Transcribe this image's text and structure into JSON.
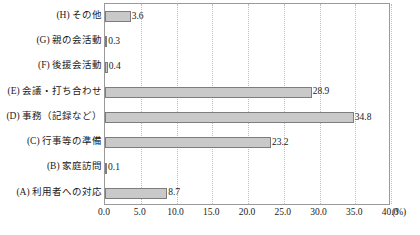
{
  "chart_data": {
    "type": "bar",
    "orientation": "horizontal",
    "title": "",
    "xlabel": "(%)",
    "ylabel": "",
    "xlim": [
      0.0,
      40.0
    ],
    "xticks": [
      "0.0",
      "5.0",
      "10.0",
      "15.0",
      "20.0",
      "25.0",
      "30.0",
      "35.0",
      "40.0"
    ],
    "xtick_values": [
      0.0,
      5.0,
      10.0,
      15.0,
      20.0,
      25.0,
      30.0,
      35.0,
      40.0
    ],
    "grid": "vertical-dotted",
    "legend": "none",
    "axis_unit": "(%)",
    "categories": [
      "(H) その他",
      "(G) 親の会活動",
      "(F) 後援会活動",
      "(E) 会議・打ち合わせ",
      "(D) 事務（記録など）",
      "(C) 行事等の準備",
      "(B) 家庭訪問",
      "(A) 利用者への対応"
    ],
    "values": [
      3.6,
      0.3,
      0.4,
      28.9,
      34.8,
      23.2,
      0.1,
      8.7
    ],
    "value_labels": [
      "3.6",
      "0.3",
      "0.4",
      "28.9",
      "34.8",
      "23.2",
      "0.1",
      "8.7"
    ],
    "bar_fill_color": "#c9c9c9",
    "bar_border_color": "#7d7d7d",
    "frame_color": "#9a9a9a",
    "gridline_color": "#bdbdbd"
  }
}
